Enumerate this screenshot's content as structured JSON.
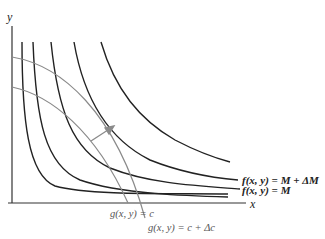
{
  "diagram": {
    "title": "",
    "axes": {
      "x_label": "x",
      "y_label": "y"
    },
    "level_curves_f": {
      "color": "#222222",
      "labels": {
        "upper": "f(x, y) = M + ΔM",
        "lower": "f(x, y) = M"
      },
      "count": 6
    },
    "constraint_curves_g": {
      "color": "#8a8a8a",
      "labels": {
        "inner": "g(x, y) = c",
        "outer": "g(x, y) = c + Δc"
      },
      "count": 2
    },
    "arrow": {
      "color": "#8a8a8a",
      "meaning": "direction of increase"
    }
  }
}
